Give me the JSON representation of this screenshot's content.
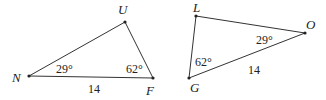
{
  "diagram": {
    "type": "geometry-two-triangles",
    "stroke_color": "#333333",
    "triangles": [
      {
        "name": "triangle-NUF",
        "vertices": [
          {
            "label": "N",
            "x": 29,
            "y": 76,
            "label_x": 12,
            "label_y": 82
          },
          {
            "label": "U",
            "x": 125,
            "y": 22,
            "label_x": 118,
            "label_y": 14
          },
          {
            "label": "F",
            "x": 153,
            "y": 78,
            "label_x": 146,
            "label_y": 95
          }
        ],
        "angles": [
          {
            "at": "N",
            "text": "29°",
            "x": 56,
            "y": 73
          },
          {
            "at": "F",
            "text": "62°",
            "x": 126,
            "y": 73
          }
        ],
        "sides": [
          {
            "between": "N-F",
            "text": "14",
            "x": 88,
            "y": 93
          }
        ]
      },
      {
        "name": "triangle-LOG",
        "vertices": [
          {
            "label": "L",
            "x": 196,
            "y": 16,
            "label_x": 193,
            "label_y": 12
          },
          {
            "label": "O",
            "x": 305,
            "y": 33,
            "label_x": 306,
            "label_y": 29
          },
          {
            "label": "G",
            "x": 189,
            "y": 78,
            "label_x": 190,
            "label_y": 92
          }
        ],
        "angles": [
          {
            "at": "O",
            "text": "29°",
            "x": 256,
            "y": 44
          },
          {
            "at": "G",
            "text": "62°",
            "x": 195,
            "y": 66
          }
        ],
        "sides": [
          {
            "between": "G-O",
            "text": "14",
            "x": 248,
            "y": 74
          }
        ]
      }
    ]
  }
}
